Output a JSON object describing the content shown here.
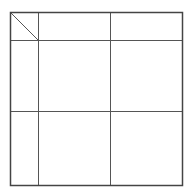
{
  "diagram": {
    "type": "table-grid",
    "line_color": "#555555",
    "outer_color": "#444444",
    "frame": {
      "x": 10,
      "y": 12,
      "w": 172,
      "h": 173
    },
    "columns_x": [
      38,
      110
    ],
    "rows_y": [
      40,
      111
    ],
    "diagonal": {
      "x1": 10,
      "y1": 12,
      "x2": 38,
      "y2": 40
    },
    "cells": []
  }
}
